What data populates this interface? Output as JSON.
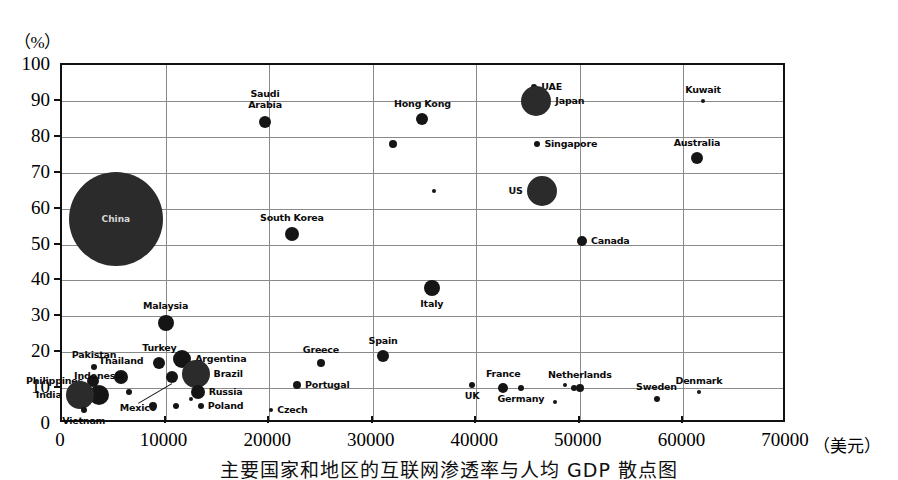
{
  "figure": {
    "y_unit_label": "（%）",
    "x_unit_label": "（美元）",
    "caption": "主要国家和地区的互联网渗透率与人均 GDP 散点图"
  },
  "chart_data": {
    "type": "scatter",
    "title": "主要国家和地区的互联网渗透率与人均 GDP 散点图",
    "xlabel": "（美元）",
    "ylabel": "（%）",
    "xlim": [
      0,
      70000
    ],
    "ylim": [
      0,
      100
    ],
    "grid": true,
    "legend": "none",
    "note": "Bubble area encodes population / internet user count.",
    "xticks": [
      "0",
      "10000",
      "20000",
      "30000",
      "40000",
      "50000",
      "60000",
      "70000"
    ],
    "yticks": [
      "0",
      "10",
      "20",
      "30",
      "40",
      "50",
      "60",
      "70",
      "80",
      "90",
      "100"
    ],
    "points": [
      {
        "label": "China",
        "x": 5200,
        "y": 57,
        "r": 47,
        "label_pos": "inside"
      },
      {
        "label": "Saudi\nArabia",
        "x": 19600,
        "y": 84,
        "r": 6,
        "label_pos": "above"
      },
      {
        "label": "Hong Kong",
        "x": 34800,
        "y": 85,
        "r": 6,
        "label_pos": "above"
      },
      {
        "label": "UAE",
        "x": 45600,
        "y": 94,
        "r": 3,
        "label_pos": "right"
      },
      {
        "label": "Japan",
        "x": 45800,
        "y": 90,
        "r": 15,
        "label_pos": "right"
      },
      {
        "label": "Kuwait",
        "x": 61900,
        "y": 90,
        "r": 2,
        "label_pos": "above"
      },
      {
        "label": "Singapore",
        "x": 45900,
        "y": 78,
        "r": 3,
        "label_pos": "right"
      },
      {
        "label": "Australia",
        "x": 61300,
        "y": 74,
        "r": 6,
        "label_pos": "above"
      },
      {
        "label": "US",
        "x": 46300,
        "y": 65,
        "r": 15,
        "label_pos": "left"
      },
      {
        "label": "South Korea",
        "x": 22200,
        "y": 53,
        "r": 7,
        "label_pos": "above"
      },
      {
        "label": "Canada",
        "x": 50200,
        "y": 51,
        "r": 5,
        "label_pos": "right"
      },
      {
        "label": "Italy",
        "x": 35700,
        "y": 38,
        "r": 8,
        "label_pos": "below"
      },
      {
        "label": "Malaysia",
        "x": 10000,
        "y": 28,
        "r": 8,
        "label_pos": "above"
      },
      {
        "label": "Greece",
        "x": 25000,
        "y": 17,
        "r": 4,
        "label_pos": "above"
      },
      {
        "label": "Spain",
        "x": 31000,
        "y": 19,
        "r": 6,
        "label_pos": "above"
      },
      {
        "label": "Turkey",
        "x": 9400,
        "y": 17,
        "r": 6,
        "label_pos": "above"
      },
      {
        "label": "Argentina",
        "x": 11600,
        "y": 18,
        "r": 9,
        "label_pos": "right"
      },
      {
        "label": "Brazil",
        "x": 12900,
        "y": 14,
        "r": 14,
        "label_pos": "right"
      },
      {
        "label": "Russia",
        "x": 13100,
        "y": 9,
        "r": 7,
        "label_pos": "right"
      },
      {
        "label": "Poland",
        "x": 13400,
        "y": 5,
        "r": 3,
        "label_pos": "right"
      },
      {
        "label": "Czech",
        "x": 20200,
        "y": 4,
        "r": 2,
        "label_pos": "right"
      },
      {
        "label": "Portugal",
        "x": 22700,
        "y": 11,
        "r": 4,
        "label_pos": "right"
      },
      {
        "label": "Pakistan",
        "x": 3100,
        "y": 16,
        "r": 3,
        "label_pos": "above"
      },
      {
        "label": "Thailand",
        "x": 5700,
        "y": 13,
        "r": 7,
        "label_pos": "above"
      },
      {
        "label": "Philippines",
        "x": 3000,
        "y": 12,
        "r": 6,
        "label_pos": "left"
      },
      {
        "label": "Indonesia",
        "x": 3600,
        "y": 8,
        "r": 10,
        "label_pos": "above"
      },
      {
        "label": "India",
        "x": 1700,
        "y": 8,
        "r": 14,
        "label_pos": "left"
      },
      {
        "label": "Vietnam",
        "x": 2100,
        "y": 4,
        "r": 3,
        "label_pos": "below"
      },
      {
        "label": "Mexico",
        "x": 10600,
        "y": 13,
        "r": 6,
        "label_pos": "leader"
      },
      {
        "label": "UK",
        "x": 39600,
        "y": 11,
        "r": 3,
        "label_pos": "below"
      },
      {
        "label": "France",
        "x": 42600,
        "y": 10,
        "r": 5,
        "label_pos": "above"
      },
      {
        "label": "Germany",
        "x": 44300,
        "y": 10,
        "r": 3,
        "label_pos": "below"
      },
      {
        "label": "Netherlands",
        "x": 50000,
        "y": 10,
        "r": 4,
        "label_pos": "above"
      },
      {
        "label": "Sweden",
        "x": 57400,
        "y": 7,
        "r": 3,
        "label_pos": "above"
      },
      {
        "label": "Denmark",
        "x": 61500,
        "y": 9,
        "r": 2,
        "label_pos": "above"
      }
    ],
    "unlabeled_points": [
      {
        "x": 32000,
        "y": 78,
        "r": 4
      },
      {
        "x": 35900,
        "y": 65,
        "r": 2
      },
      {
        "x": 6500,
        "y": 9,
        "r": 3
      },
      {
        "x": 8800,
        "y": 5,
        "r": 4
      },
      {
        "x": 11000,
        "y": 5,
        "r": 3
      },
      {
        "x": 12500,
        "y": 7,
        "r": 2
      },
      {
        "x": 48600,
        "y": 11,
        "r": 2
      },
      {
        "x": 49400,
        "y": 10,
        "r": 3
      },
      {
        "x": 47600,
        "y": 6,
        "r": 2
      }
    ]
  }
}
